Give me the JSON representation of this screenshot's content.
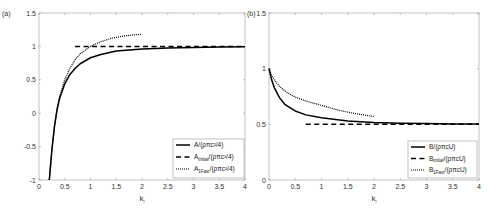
{
  "chart_data": [
    {
      "panel_label": "(a)",
      "type": "line",
      "title": "",
      "xlabel": "k",
      "xlabel_sub": "i",
      "ylabel": "",
      "xlim": [
        0,
        4
      ],
      "ylim": [
        -1,
        1.5
      ],
      "xticks": [
        "0",
        "0.5",
        "1",
        "1.5",
        "2",
        "2.5",
        "3",
        "3.5",
        "4"
      ],
      "yticks": [
        "-1",
        "-0.5",
        "0",
        "0.5",
        "1",
        "1.5"
      ],
      "grid": false,
      "legend_position": "lower right",
      "series": [
        {
          "name": "A/(ρπc²/4)",
          "label_main": "A/(ρπc²/4)",
          "label_sub": "",
          "style": "solid",
          "x": [
            0.2,
            0.25,
            0.3,
            0.35,
            0.4,
            0.5,
            0.6,
            0.7,
            0.8,
            1.0,
            1.2,
            1.5,
            2.0,
            2.5,
            3.0,
            3.5,
            4.0
          ],
          "y": [
            -1.0,
            -0.55,
            -0.2,
            0.05,
            0.22,
            0.44,
            0.58,
            0.67,
            0.74,
            0.83,
            0.88,
            0.93,
            0.96,
            0.975,
            0.985,
            0.99,
            0.995
          ]
        },
        {
          "name": "A_initial/(ρπc²/4)",
          "label_main": "A",
          "label_sub": "initial",
          "label_rest": "/(ρπc²/4)",
          "style": "dashed",
          "x": [
            0.7,
            4.0
          ],
          "y": [
            1.0,
            1.0
          ]
        },
        {
          "name": "A_1Fast/(ρπc²/4)",
          "label_main": "A",
          "label_sub": "1Fast",
          "label_rest": "/(ρπc²/4)",
          "style": "dotted",
          "x": [
            0.2,
            0.25,
            0.3,
            0.35,
            0.4,
            0.5,
            0.6,
            0.7,
            0.8,
            1.0,
            1.2,
            1.4,
            1.6,
            1.8,
            2.0
          ],
          "y": [
            -1.0,
            -0.55,
            -0.2,
            0.06,
            0.25,
            0.5,
            0.67,
            0.8,
            0.89,
            1.0,
            1.07,
            1.12,
            1.15,
            1.17,
            1.18
          ]
        }
      ]
    },
    {
      "panel_label": "(b)",
      "type": "line",
      "title": "",
      "xlabel": "k",
      "xlabel_sub": "i",
      "ylabel": "",
      "xlim": [
        0,
        4
      ],
      "ylim": [
        0,
        1.5
      ],
      "xticks": [
        "0",
        "0.5",
        "1",
        "1.5",
        "2",
        "2.5",
        "3",
        "3.5",
        "4"
      ],
      "yticks": [
        "0",
        "0.5",
        "1",
        "1.5"
      ],
      "grid": false,
      "legend_position": "lower right",
      "series": [
        {
          "name": "B/(ρπcU)",
          "label_main": "B/(ρπcU)",
          "label_sub": "",
          "style": "solid",
          "x": [
            0.0,
            0.05,
            0.1,
            0.2,
            0.3,
            0.4,
            0.5,
            0.7,
            1.0,
            1.5,
            2.0,
            2.5,
            3.0,
            3.5,
            4.0
          ],
          "y": [
            1.0,
            0.9,
            0.83,
            0.74,
            0.68,
            0.65,
            0.62,
            0.585,
            0.56,
            0.53,
            0.517,
            0.51,
            0.507,
            0.504,
            0.502
          ]
        },
        {
          "name": "B_initial/(ρπcU)",
          "label_main": "B",
          "label_sub": "initial",
          "label_rest": "/(ρπcU)",
          "style": "dashed",
          "x": [
            0.7,
            4.0
          ],
          "y": [
            0.5,
            0.5
          ]
        },
        {
          "name": "B_1Fast/(ρπcU)",
          "label_main": "B",
          "label_sub": "1Fast",
          "label_rest": "/(ρπcU)",
          "style": "dotted",
          "x": [
            0.0,
            0.05,
            0.1,
            0.2,
            0.3,
            0.4,
            0.5,
            0.7,
            1.0,
            1.3,
            1.6,
            2.0
          ],
          "y": [
            1.0,
            0.94,
            0.9,
            0.84,
            0.8,
            0.77,
            0.745,
            0.71,
            0.67,
            0.63,
            0.6,
            0.57
          ]
        }
      ]
    }
  ]
}
